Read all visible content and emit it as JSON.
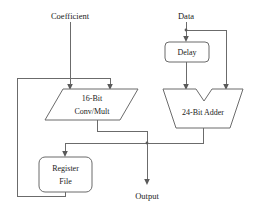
{
  "diagram": {
    "background_color": "#ffffff",
    "line_color": "#6b6b6b",
    "text_color": "#1a1a1a",
    "inputs": [
      {
        "id": "coefficient",
        "label": "Coefficient"
      },
      {
        "id": "data",
        "label": "Data"
      }
    ],
    "outputs": [
      {
        "id": "output",
        "label": "Output"
      }
    ],
    "blocks": [
      {
        "id": "delay",
        "label": "Delay",
        "shape": "rounded-rectangle"
      },
      {
        "id": "conv-mult",
        "label_line1": "16-Bit",
        "label_line2": "Conv/Mult",
        "shape": "parallelogram"
      },
      {
        "id": "adder",
        "label": "24-Bit Adder",
        "shape": "adder-trapezoid"
      },
      {
        "id": "register-file",
        "label_line1": "Register",
        "label_line2": "File",
        "shape": "rounded-rectangle"
      }
    ]
  }
}
